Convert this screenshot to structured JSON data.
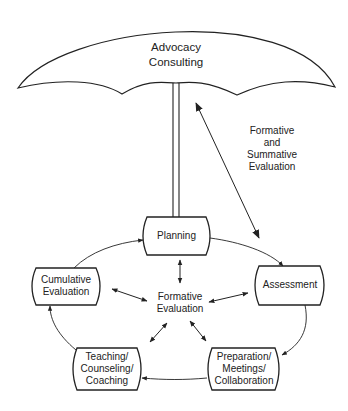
{
  "umbrella": {
    "line1": "Advocacy",
    "line2": "Consulting"
  },
  "side_label": {
    "line1": "Formative",
    "line2": "and",
    "line3": "Summative",
    "line4": "Evaluation"
  },
  "center": {
    "line1": "Formative",
    "line2": "Evaluation"
  },
  "nodes": {
    "planning": {
      "line1": "Planning"
    },
    "assessment": {
      "line1": "Assessment"
    },
    "preparation": {
      "line1": "Preparation/",
      "line2": "Meetings/",
      "line3": "Collaboration"
    },
    "teaching": {
      "line1": "Teaching/",
      "line2": "Counseling/",
      "line3": "Coaching"
    },
    "cumulative": {
      "line1": "Cumulative",
      "line2": "Evaluation"
    }
  },
  "colors": {
    "stroke": "#222222",
    "background": "#ffffff"
  }
}
